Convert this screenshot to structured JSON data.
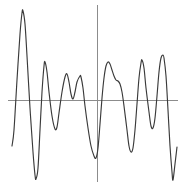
{
  "chart_data": {
    "type": "line",
    "title": "",
    "subtitle": "",
    "xlabel": "",
    "ylabel": "",
    "grid": false,
    "legend": false,
    "legend_position": "none",
    "axis_style": "crosshair",
    "xlim": [
      0,
      186
    ],
    "ylim": [
      0,
      187
    ],
    "zero_line_y": 100,
    "origin_line_x": 97,
    "x_axis_extent": [
      8,
      178
    ],
    "y_axis_extent": [
      5,
      182
    ],
    "colors": {
      "series": "#3a3a3a",
      "axis": "#8c8c8c",
      "background": "#ffffff"
    },
    "series": [
      {
        "name": "signal",
        "points": [
          [
            12,
            146
          ],
          [
            14,
            130
          ],
          [
            17,
            80
          ],
          [
            20,
            34
          ],
          [
            22,
            13
          ],
          [
            23,
            11
          ],
          [
            25,
            24
          ],
          [
            27,
            56
          ],
          [
            30,
            108
          ],
          [
            33,
            152
          ],
          [
            35,
            175
          ],
          [
            36,
            179
          ],
          [
            38,
            168
          ],
          [
            40,
            130
          ],
          [
            42,
            92
          ],
          [
            44,
            66
          ],
          [
            45,
            62
          ],
          [
            47,
            72
          ],
          [
            49,
            92
          ],
          [
            52,
            116
          ],
          [
            55,
            129
          ],
          [
            57,
            127
          ],
          [
            59,
            113
          ],
          [
            62,
            92
          ],
          [
            65,
            77
          ],
          [
            67,
            74
          ],
          [
            69,
            82
          ],
          [
            71,
            94
          ],
          [
            73,
            99
          ],
          [
            75,
            92
          ],
          [
            77,
            82
          ],
          [
            80,
            76
          ],
          [
            81,
            77
          ],
          [
            83,
            88
          ],
          [
            85,
            106
          ],
          [
            88,
            128
          ],
          [
            91,
            146
          ],
          [
            94,
            156
          ],
          [
            96,
            158
          ],
          [
            98,
            148
          ],
          [
            100,
            124
          ],
          [
            102,
            98
          ],
          [
            104,
            78
          ],
          [
            106,
            66
          ],
          [
            108,
            62
          ],
          [
            110,
            64
          ],
          [
            112,
            70
          ],
          [
            114,
            76
          ],
          [
            116,
            80
          ],
          [
            118,
            81
          ],
          [
            120,
            84
          ],
          [
            122,
            92
          ],
          [
            124,
            106
          ],
          [
            127,
            130
          ],
          [
            129,
            146
          ],
          [
            131,
            152
          ],
          [
            133,
            148
          ],
          [
            135,
            130
          ],
          [
            137,
            104
          ],
          [
            139,
            78
          ],
          [
            141,
            63
          ],
          [
            142,
            60
          ],
          [
            144,
            68
          ],
          [
            146,
            88
          ],
          [
            149,
            112
          ],
          [
            151,
            126
          ],
          [
            153,
            128
          ],
          [
            155,
            118
          ],
          [
            157,
            96
          ],
          [
            159,
            72
          ],
          [
            161,
            58
          ],
          [
            163,
            55
          ],
          [
            164,
            58
          ],
          [
            166,
            76
          ],
          [
            168,
            110
          ],
          [
            170,
            146
          ],
          [
            172,
            172
          ],
          [
            173,
            180
          ],
          [
            175,
            164
          ],
          [
            177,
            147
          ]
        ]
      }
    ],
    "annotations": []
  }
}
